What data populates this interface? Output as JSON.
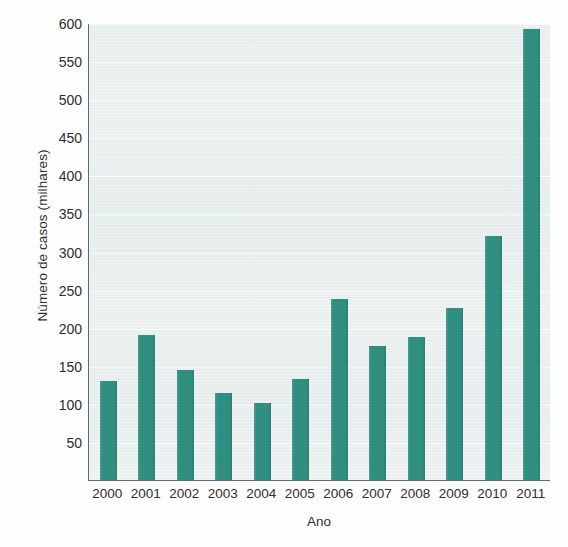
{
  "chart_data": {
    "type": "bar",
    "title": "",
    "subtitle": "",
    "xlabel": "Ano",
    "ylabel": "Número de casos (milhares)",
    "categories": [
      "2000",
      "2001",
      "2002",
      "2003",
      "2004",
      "2005",
      "2006",
      "2007",
      "2008",
      "2009",
      "2010",
      "2011"
    ],
    "values": [
      130,
      190,
      145,
      114,
      101,
      133,
      238,
      176,
      188,
      226,
      321,
      592
    ],
    "series": [
      {
        "name": "Número de casos (milhares)",
        "values": [
          130,
          190,
          145,
          114,
          101,
          133,
          238,
          176,
          188,
          226,
          321,
          592
        ]
      }
    ],
    "ylim": [
      0,
      600
    ],
    "yticks": [
      50,
      100,
      150,
      200,
      250,
      300,
      350,
      400,
      450,
      500,
      550,
      600
    ],
    "ytick_labels": [
      "50",
      "100",
      "150",
      "200",
      "250",
      "300",
      "350",
      "400",
      "450",
      "500",
      "550",
      "600"
    ],
    "grid": true,
    "legend": null,
    "legend_position": "none",
    "bar_color": "#1c8576",
    "plot_background": "#eef3f2",
    "axis_color": "#5d6d6d"
  }
}
